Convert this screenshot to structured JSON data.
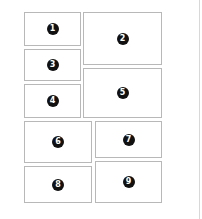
{
  "diagram": {
    "type": "layout-grid",
    "border_color": "#b8b8b8",
    "badge_color": "#111111",
    "panels": [
      {
        "id": 1,
        "label": "1",
        "x": 24,
        "y": 12,
        "w": 57,
        "h": 34
      },
      {
        "id": 2,
        "label": "2",
        "x": 83,
        "y": 12,
        "w": 79,
        "h": 53
      },
      {
        "id": 3,
        "label": "3",
        "x": 24,
        "y": 49,
        "w": 57,
        "h": 32
      },
      {
        "id": 4,
        "label": "4",
        "x": 24,
        "y": 84,
        "w": 57,
        "h": 34
      },
      {
        "id": 5,
        "label": "5",
        "x": 83,
        "y": 68,
        "w": 79,
        "h": 50
      },
      {
        "id": 6,
        "label": "6",
        "x": 24,
        "y": 121,
        "w": 68,
        "h": 42
      },
      {
        "id": 7,
        "label": "7",
        "x": 95,
        "y": 121,
        "w": 67,
        "h": 37
      },
      {
        "id": 8,
        "label": "8",
        "x": 24,
        "y": 166,
        "w": 68,
        "h": 37
      },
      {
        "id": 9,
        "label": "9",
        "x": 95,
        "y": 161,
        "w": 67,
        "h": 42
      }
    ]
  }
}
